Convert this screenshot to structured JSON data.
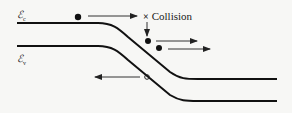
{
  "diagram": {
    "type": "band-diagram",
    "labels": {
      "conduction_band": {
        "symbol": "ℰ",
        "subscript": "c"
      },
      "valence_band": {
        "symbol": "ℰ",
        "subscript": "v"
      },
      "collision": {
        "marker": "×",
        "text": "Collision"
      }
    },
    "colors": {
      "line": "#111111",
      "arrow": "#333333",
      "background": "#f7f7f5"
    },
    "elements": [
      {
        "kind": "electron",
        "x": 78,
        "y": 17,
        "arrow_direction": "right"
      },
      {
        "kind": "collision-point",
        "x": 146,
        "y": 17
      },
      {
        "kind": "electron",
        "x": 148,
        "y": 41,
        "arrow_direction": "right"
      },
      {
        "kind": "electron",
        "x": 159,
        "y": 48,
        "arrow_direction": "right"
      },
      {
        "kind": "hole",
        "x": 147,
        "y": 77,
        "arrow_direction": "left"
      }
    ]
  }
}
